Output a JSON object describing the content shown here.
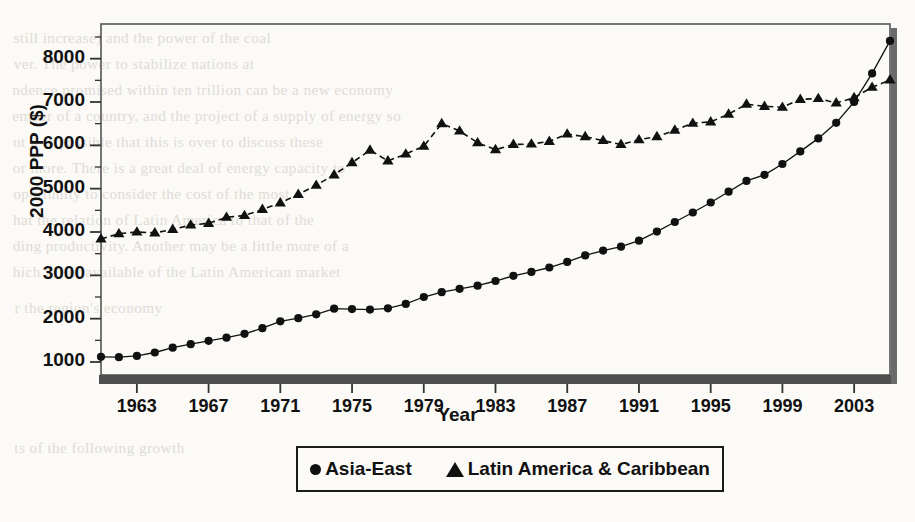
{
  "figure": {
    "background_color": "#fbfaf7",
    "ink_color": "#111111",
    "axis_bar_color": "#4a4a4a"
  },
  "axis_titles": {
    "x": "Year",
    "y": "2000 PPP ($)"
  },
  "legend": {
    "items": [
      {
        "marker": "circle-marker",
        "label": "Asia-East"
      },
      {
        "marker": "triangle-marker",
        "label": "Latin America & Caribbean"
      }
    ]
  },
  "bleed_through_text": [
    {
      "x": 16,
      "y": 30,
      "text": "still increase) and the power of the coal"
    },
    {
      "x": 16,
      "y": 56,
      "text": "ver. The power to stabilize nations at"
    },
    {
      "x": 16,
      "y": 82,
      "text": "ndence promised within ten trillion can be a new economy"
    },
    {
      "x": 16,
      "y": 108,
      "text": "ember of a country, and the project of a supply of energy so"
    },
    {
      "x": 16,
      "y": 134,
      "text": "ut it is possible that this is over to discuss these"
    },
    {
      "x": 16,
      "y": 160,
      "text": "or more. There is a great deal of energy capacity to"
    },
    {
      "x": 16,
      "y": 186,
      "text": "oportunity to consider the cost of the most"
    },
    {
      "x": 16,
      "y": 212,
      "text": "hat the relation of Latin America to that of the"
    },
    {
      "x": 16,
      "y": 238,
      "text": "ding productivity. Another may be a little more of a"
    },
    {
      "x": 16,
      "y": 264,
      "text": "hich is not available of the Latin American market"
    },
    {
      "x": 16,
      "y": 300,
      "text": "r the region's economy"
    },
    {
      "x": 16,
      "y": 440,
      "text": "ts of the following growth"
    }
  ],
  "chart_data": {
    "type": "line",
    "title": "",
    "xlabel": "Year",
    "ylabel": "2000 PPP ($)",
    "xlim": [
      1961,
      2005
    ],
    "ylim": [
      700,
      8800
    ],
    "grid": false,
    "legend_position": "below-axis",
    "y_major_ticks": [
      1000,
      2000,
      3000,
      4000,
      5000,
      6000,
      7000,
      8000
    ],
    "y_minor_tick_step": 500,
    "x_tick_labels": [
      1963,
      1967,
      1971,
      1975,
      1979,
      1983,
      1987,
      1991,
      1995,
      1999,
      2003
    ],
    "x_tick_step": 4,
    "x": [
      1961,
      1962,
      1963,
      1964,
      1965,
      1966,
      1967,
      1968,
      1969,
      1970,
      1971,
      1972,
      1973,
      1974,
      1975,
      1976,
      1977,
      1978,
      1979,
      1980,
      1981,
      1982,
      1983,
      1984,
      1985,
      1986,
      1987,
      1988,
      1989,
      1990,
      1991,
      1992,
      1993,
      1994,
      1995,
      1996,
      1997,
      1998,
      1999,
      2000,
      2001,
      2002,
      2003,
      2004,
      2005
    ],
    "series": [
      {
        "name": "Asia-East",
        "marker": "circle",
        "line_style": "solid",
        "color": "#111111",
        "values": [
          1120,
          1110,
          1140,
          1220,
          1330,
          1410,
          1490,
          1560,
          1650,
          1780,
          1940,
          2010,
          2100,
          2230,
          2220,
          2210,
          2240,
          2340,
          2500,
          2610,
          2690,
          2760,
          2870,
          2990,
          3080,
          3180,
          3310,
          3460,
          3570,
          3660,
          3800,
          4010,
          4230,
          4450,
          4680,
          4930,
          5180,
          5320,
          5570,
          5860,
          6160,
          6520,
          7000,
          7660,
          8410
        ]
      },
      {
        "name": "Latin America & Caribbean",
        "marker": "triangle",
        "line_style": "dashed",
        "color": "#111111",
        "values": [
          3840,
          3960,
          4000,
          3980,
          4060,
          4160,
          4200,
          4340,
          4380,
          4520,
          4670,
          4870,
          5080,
          5320,
          5600,
          5890,
          5640,
          5800,
          5980,
          6500,
          6330,
          6060,
          5900,
          6020,
          6030,
          6090,
          6260,
          6200,
          6110,
          6020,
          6130,
          6200,
          6350,
          6510,
          6540,
          6720,
          6950,
          6900,
          6880,
          7060,
          7080,
          6980,
          7100,
          7340,
          7510
        ]
      }
    ]
  }
}
